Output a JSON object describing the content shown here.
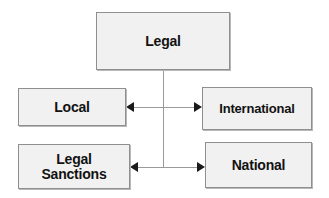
{
  "diagram": {
    "title": "Legal",
    "type": "hierarchy-flow-diagram",
    "background_color": "#ffffff",
    "node_fill_color": "#f1f1f1",
    "node_border_color": "#8f8f8f",
    "connector_color": "#9a9a9a",
    "arrow_color": "#1a1a1a",
    "nodes": [
      {
        "id": "legal",
        "label": "Legal",
        "role": "root"
      },
      {
        "id": "local",
        "label": "Local",
        "role": "branch"
      },
      {
        "id": "international",
        "label": "International",
        "role": "branch"
      },
      {
        "id": "legal_sanctions",
        "label": "Legal\nSanctions",
        "role": "branch"
      },
      {
        "id": "national",
        "label": "National",
        "role": "branch"
      }
    ],
    "connectors": [
      {
        "id": "trunk",
        "from": "legal",
        "to": "junction",
        "style": "vertical-line"
      },
      {
        "id": "upper-row",
        "from": "international",
        "to": "local",
        "style": "bidirectional-horizontal"
      },
      {
        "id": "lower-row",
        "from": "national",
        "to": "legal_sanctions",
        "style": "bidirectional-horizontal"
      }
    ],
    "arrows": [
      {
        "id": "to-local",
        "direction": "left",
        "target": "local"
      },
      {
        "id": "to-international",
        "direction": "right",
        "target": "international"
      },
      {
        "id": "to-legal-sanctions",
        "direction": "left",
        "target": "legal_sanctions"
      },
      {
        "id": "to-national",
        "direction": "right",
        "target": "national"
      }
    ]
  }
}
